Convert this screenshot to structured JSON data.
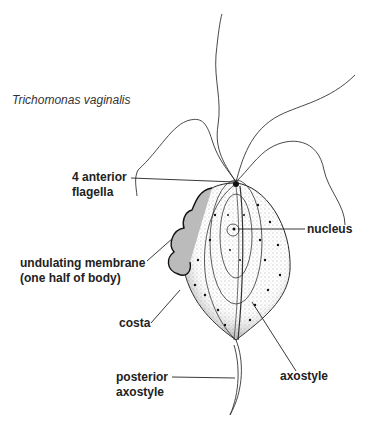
{
  "title": "Trichomonas vaginalis",
  "labels": {
    "flagella_line1": "4 anterior",
    "flagella_line2": "flagella",
    "nucleus": "nucleus",
    "membrane_line1": "undulating membrane",
    "membrane_line2": "(one half of body)",
    "costa": "costa",
    "axostyle": "axostyle",
    "posterior_line1": "posterior",
    "posterior_line2": "axostyle"
  },
  "colors": {
    "ink": "#222222",
    "background": "#ffffff"
  }
}
